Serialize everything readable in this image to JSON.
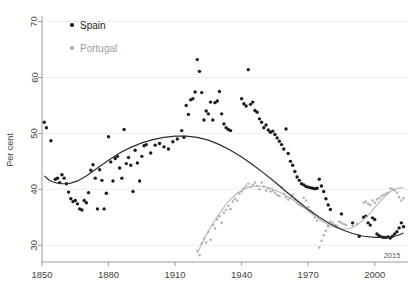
{
  "chart_data": {
    "type": "scatter",
    "title": "",
    "xlabel": "",
    "ylabel": "Per cent",
    "xlim": [
      1850,
      2015
    ],
    "ylim": [
      27,
      71
    ],
    "xticks": [
      1850,
      1880,
      1910,
      1940,
      1970,
      2000
    ],
    "xtick_labels": [
      "1850",
      "1880",
      "1910",
      "1940",
      "1970",
      "2000"
    ],
    "x_end_label": "2015",
    "yticks": [
      30,
      40,
      50,
      60,
      70
    ],
    "ytick_labels": [
      "30",
      "40",
      "50",
      "60",
      "70"
    ],
    "grid": "horizontal",
    "legend_position": "top-left",
    "series": [
      {
        "name": "Spain",
        "color": "#1a1a1a",
        "marker": "filled-circle",
        "points": [
          [
            1851,
            52.0
          ],
          [
            1852,
            51.0
          ],
          [
            1854,
            48.7
          ],
          [
            1856,
            41.8
          ],
          [
            1857,
            42.0
          ],
          [
            1858,
            41.2
          ],
          [
            1859,
            42.6
          ],
          [
            1860,
            42.0
          ],
          [
            1861,
            41.0
          ],
          [
            1862,
            39.5
          ],
          [
            1863,
            38.3
          ],
          [
            1864,
            37.8
          ],
          [
            1865,
            38.0
          ],
          [
            1866,
            37.4
          ],
          [
            1867,
            36.5
          ],
          [
            1868,
            36.3
          ],
          [
            1869,
            38.0
          ],
          [
            1870,
            37.6
          ],
          [
            1871,
            39.4
          ],
          [
            1872,
            43.4
          ],
          [
            1873,
            44.4
          ],
          [
            1874,
            42.0
          ],
          [
            1875,
            36.5
          ],
          [
            1876,
            43.5
          ],
          [
            1877,
            41.6
          ],
          [
            1878,
            36.5
          ],
          [
            1879,
            39.3
          ],
          [
            1880,
            49.4
          ],
          [
            1881,
            44.9
          ],
          [
            1882,
            41.5
          ],
          [
            1883,
            45.5
          ],
          [
            1884,
            45.9
          ],
          [
            1885,
            43.8
          ],
          [
            1886,
            42.0
          ],
          [
            1887,
            50.7
          ],
          [
            1888,
            44.6
          ],
          [
            1889,
            45.7
          ],
          [
            1890,
            44.3
          ],
          [
            1891,
            39.6
          ],
          [
            1892,
            47.0
          ],
          [
            1893,
            44.7
          ],
          [
            1894,
            41.5
          ],
          [
            1895,
            45.9
          ],
          [
            1896,
            47.8
          ],
          [
            1897,
            48.0
          ],
          [
            1899,
            46.5
          ],
          [
            1901,
            47.9
          ],
          [
            1903,
            48.2
          ],
          [
            1905,
            47.6
          ],
          [
            1907,
            47.2
          ],
          [
            1909,
            48.5
          ],
          [
            1911,
            49.0
          ],
          [
            1913,
            50.5
          ],
          [
            1914,
            49.3
          ],
          [
            1915,
            55.0
          ],
          [
            1916,
            53.4
          ],
          [
            1917,
            56.0
          ],
          [
            1918,
            56.2
          ],
          [
            1919,
            57.4
          ],
          [
            1920,
            63.2
          ],
          [
            1921,
            61.1
          ],
          [
            1922,
            57.3
          ],
          [
            1923,
            52.4
          ],
          [
            1924,
            54.0
          ],
          [
            1925,
            53.5
          ],
          [
            1926,
            55.6
          ],
          [
            1927,
            52.4
          ],
          [
            1928,
            55.5
          ],
          [
            1929,
            55.8
          ],
          [
            1930,
            57.5
          ],
          [
            1931,
            53.5
          ],
          [
            1932,
            51.7
          ],
          [
            1933,
            51.0
          ],
          [
            1934,
            50.7
          ],
          [
            1935,
            50.5
          ],
          [
            1940,
            56.2
          ],
          [
            1941,
            55.3
          ],
          [
            1942,
            54.9
          ],
          [
            1943,
            61.4
          ],
          [
            1944,
            55.2
          ],
          [
            1945,
            55.6
          ],
          [
            1946,
            54.1
          ],
          [
            1947,
            53.8
          ],
          [
            1948,
            52.6
          ],
          [
            1949,
            52.0
          ],
          [
            1950,
            51.0
          ],
          [
            1951,
            51.5
          ],
          [
            1952,
            50.6
          ],
          [
            1953,
            50.2
          ],
          [
            1954,
            50.4
          ],
          [
            1955,
            49.8
          ],
          [
            1956,
            49.2
          ],
          [
            1957,
            48.6
          ],
          [
            1958,
            48.0
          ],
          [
            1959,
            47.2
          ],
          [
            1960,
            50.8
          ],
          [
            1961,
            46.4
          ],
          [
            1962,
            45.0
          ],
          [
            1963,
            44.3
          ],
          [
            1964,
            43.2
          ],
          [
            1965,
            42.2
          ],
          [
            1966,
            41.6
          ],
          [
            1967,
            41.0
          ],
          [
            1968,
            40.8
          ],
          [
            1969,
            40.5
          ],
          [
            1970,
            40.4
          ],
          [
            1971,
            40.3
          ],
          [
            1972,
            40.2
          ],
          [
            1973,
            40.1
          ],
          [
            1974,
            40.2
          ],
          [
            1975,
            41.8
          ],
          [
            1976,
            40.6
          ],
          [
            1977,
            39.6
          ],
          [
            1978,
            38.3
          ],
          [
            1979,
            37.2
          ],
          [
            1980,
            36.4
          ],
          [
            1985,
            35.6
          ],
          [
            1990,
            34.0
          ],
          [
            1993,
            31.6
          ],
          [
            1995,
            35.0
          ],
          [
            1996,
            35.2
          ],
          [
            1997,
            34.0
          ],
          [
            1998,
            33.6
          ],
          [
            1999,
            34.9
          ],
          [
            2000,
            34.6
          ],
          [
            2001,
            32.0
          ],
          [
            2002,
            31.7
          ],
          [
            2003,
            31.5
          ],
          [
            2004,
            31.4
          ],
          [
            2005,
            31.4
          ],
          [
            2006,
            31.5
          ],
          [
            2007,
            31.3
          ],
          [
            2008,
            31.6
          ],
          [
            2009,
            32.0
          ],
          [
            2010,
            32.4
          ],
          [
            2011,
            33.1
          ],
          [
            2012,
            34.0
          ],
          [
            2013,
            33.3
          ]
        ]
      },
      {
        "name": "Portugal",
        "color": "#b0b0b0",
        "marker": "filled-circle-small",
        "points": [
          [
            1920,
            29.0
          ],
          [
            1921,
            28.2
          ],
          [
            1922,
            30.3
          ],
          [
            1923,
            31.2
          ],
          [
            1924,
            30.5
          ],
          [
            1925,
            32.4
          ],
          [
            1926,
            31.0
          ],
          [
            1927,
            33.6
          ],
          [
            1928,
            33.0
          ],
          [
            1929,
            34.6
          ],
          [
            1930,
            35.2
          ],
          [
            1931,
            34.0
          ],
          [
            1932,
            35.8
          ],
          [
            1933,
            36.3
          ],
          [
            1934,
            37.0
          ],
          [
            1935,
            36.5
          ],
          [
            1936,
            37.8
          ],
          [
            1937,
            38.3
          ],
          [
            1938,
            38.0
          ],
          [
            1939,
            39.2
          ],
          [
            1940,
            39.6
          ],
          [
            1941,
            40.2
          ],
          [
            1942,
            40.6
          ],
          [
            1943,
            41.0
          ],
          [
            1944,
            40.4
          ],
          [
            1945,
            40.8
          ],
          [
            1946,
            41.2
          ],
          [
            1947,
            40.6
          ],
          [
            1948,
            40.0
          ],
          [
            1949,
            41.2
          ],
          [
            1950,
            40.5
          ],
          [
            1951,
            39.8
          ],
          [
            1952,
            40.2
          ],
          [
            1953,
            39.6
          ],
          [
            1954,
            39.8
          ],
          [
            1955,
            39.4
          ],
          [
            1956,
            39.0
          ],
          [
            1957,
            38.8
          ],
          [
            1958,
            40.4
          ],
          [
            1959,
            39.2
          ],
          [
            1960,
            38.6
          ],
          [
            1961,
            38.2
          ],
          [
            1962,
            38.5
          ],
          [
            1963,
            39.0
          ],
          [
            1964,
            38.2
          ],
          [
            1965,
            37.6
          ],
          [
            1966,
            37.2
          ],
          [
            1967,
            37.0
          ],
          [
            1968,
            38.5
          ],
          [
            1969,
            38.0
          ],
          [
            1970,
            36.8
          ],
          [
            1971,
            36.2
          ],
          [
            1972,
            35.8
          ],
          [
            1973,
            35.0
          ],
          [
            1974,
            34.4
          ],
          [
            1975,
            29.6
          ],
          [
            1976,
            30.8
          ],
          [
            1977,
            31.8
          ],
          [
            1978,
            32.6
          ],
          [
            1979,
            33.4
          ],
          [
            1980,
            34.2
          ],
          [
            1981,
            34.0
          ],
          [
            1982,
            33.6
          ],
          [
            1983,
            33.5
          ],
          [
            1984,
            34.2
          ],
          [
            1985,
            34.0
          ],
          [
            1986,
            33.8
          ],
          [
            1987,
            33.6
          ],
          [
            1990,
            33.5
          ],
          [
            1992,
            33.8
          ],
          [
            1995,
            37.6
          ],
          [
            1996,
            37.8
          ],
          [
            1997,
            37.4
          ],
          [
            1998,
            37.2
          ],
          [
            1999,
            38.0
          ],
          [
            2000,
            37.6
          ],
          [
            2001,
            38.2
          ],
          [
            2002,
            38.4
          ],
          [
            2003,
            38.8
          ],
          [
            2004,
            39.0
          ],
          [
            2005,
            39.2
          ],
          [
            2006,
            39.4
          ],
          [
            2007,
            40.2
          ],
          [
            2008,
            40.0
          ],
          [
            2009,
            39.8
          ],
          [
            2010,
            39.4
          ],
          [
            2011,
            38.6
          ],
          [
            2012,
            38.0
          ],
          [
            2013,
            38.4
          ]
        ]
      }
    ],
    "fits": [
      {
        "name": "Spain trend",
        "color": "#2b2b2b",
        "values": [
          [
            1851,
            42.4
          ],
          [
            1853,
            41.7
          ],
          [
            1855,
            41.3
          ],
          [
            1857,
            41.1
          ],
          [
            1859,
            41.0
          ],
          [
            1861,
            41.0
          ],
          [
            1863,
            41.1
          ],
          [
            1866,
            41.5
          ],
          [
            1870,
            42.4
          ],
          [
            1875,
            43.8
          ],
          [
            1880,
            45.2
          ],
          [
            1885,
            46.5
          ],
          [
            1890,
            47.5
          ],
          [
            1895,
            48.3
          ],
          [
            1900,
            48.9
          ],
          [
            1905,
            49.3
          ],
          [
            1910,
            49.5
          ],
          [
            1915,
            49.5
          ],
          [
            1920,
            49.3
          ],
          [
            1925,
            48.8
          ],
          [
            1930,
            48.0
          ],
          [
            1935,
            47.0
          ],
          [
            1940,
            45.8
          ],
          [
            1945,
            44.4
          ],
          [
            1950,
            42.9
          ],
          [
            1955,
            41.3
          ],
          [
            1960,
            39.6
          ],
          [
            1965,
            38.0
          ],
          [
            1970,
            36.4
          ],
          [
            1975,
            35.0
          ],
          [
            1980,
            33.8
          ],
          [
            1985,
            32.8
          ],
          [
            1990,
            32.1
          ],
          [
            1995,
            31.6
          ],
          [
            2000,
            31.4
          ],
          [
            2005,
            31.4
          ],
          [
            2010,
            31.7
          ],
          [
            2013,
            32.2
          ]
        ]
      },
      {
        "name": "Portugal trend",
        "color": "#b5b5b5",
        "values": [
          [
            1920,
            28.6
          ],
          [
            1922,
            30.2
          ],
          [
            1924,
            31.8
          ],
          [
            1926,
            33.2
          ],
          [
            1928,
            34.5
          ],
          [
            1930,
            35.7
          ],
          [
            1932,
            36.8
          ],
          [
            1934,
            37.8
          ],
          [
            1936,
            38.6
          ],
          [
            1938,
            39.3
          ],
          [
            1940,
            39.8
          ],
          [
            1942,
            40.2
          ],
          [
            1944,
            40.5
          ],
          [
            1946,
            40.6
          ],
          [
            1948,
            40.6
          ],
          [
            1950,
            40.5
          ],
          [
            1953,
            40.2
          ],
          [
            1956,
            39.7
          ],
          [
            1959,
            39.1
          ],
          [
            1962,
            38.4
          ],
          [
            1965,
            37.6
          ],
          [
            1968,
            36.7
          ],
          [
            1971,
            35.8
          ],
          [
            1974,
            34.9
          ],
          [
            1977,
            34.1
          ],
          [
            1980,
            33.5
          ],
          [
            1983,
            33.1
          ],
          [
            1986,
            32.9
          ],
          [
            1989,
            33.0
          ],
          [
            1992,
            33.6
          ],
          [
            1995,
            34.6
          ],
          [
            1998,
            35.8
          ],
          [
            2001,
            37.2
          ],
          [
            2004,
            38.5
          ],
          [
            2007,
            39.6
          ],
          [
            2010,
            40.2
          ],
          [
            2013,
            40.3
          ]
        ]
      }
    ]
  },
  "legend": {
    "items": [
      {
        "label": "Spain",
        "color": "#1a1a1a"
      },
      {
        "label": "Portugal",
        "color": "#b0b0b0"
      }
    ]
  },
  "axes": {
    "y_title": "Per cent",
    "x_end_label": "2015"
  }
}
